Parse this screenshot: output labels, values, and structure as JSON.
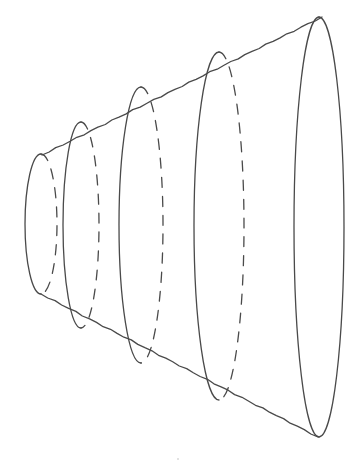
{
  "figure": {
    "background_color": "#ffffff",
    "line_color": "#4a4a4a",
    "profile": {
      "top_line": {
        "x1": 42,
        "y1": 155,
        "x2": 322,
        "y2": 17
      },
      "bottom_line": {
        "x1": 41,
        "y1": 294,
        "x2": 318,
        "y2": 437
      }
    },
    "cross_sections": [
      {
        "index": 1,
        "cx": 41,
        "cy": 224,
        "rx": 16,
        "ry": 70,
        "front": "solid",
        "back": "dashed"
      },
      {
        "index": 2,
        "cx": 81,
        "cy": 225,
        "rx": 18,
        "ry": 103,
        "front": "solid",
        "back": "dashed"
      },
      {
        "index": 3,
        "cx": 141,
        "cy": 225,
        "rx": 22,
        "ry": 138,
        "front": "solid",
        "back": "dashed"
      },
      {
        "index": 4,
        "cx": 219,
        "cy": 226,
        "rx": 25,
        "ry": 174,
        "front": "solid",
        "back": "dashed"
      },
      {
        "index": 5,
        "cx": 319,
        "cy": 227,
        "rx": 25,
        "ry": 210,
        "front": "solid",
        "back": "solid"
      }
    ]
  }
}
